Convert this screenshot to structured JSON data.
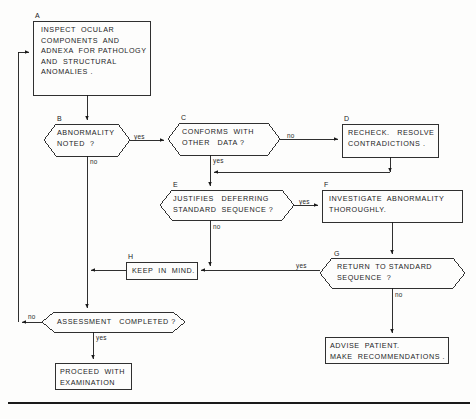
{
  "diagram": {
    "line_color": "#1a1a1a",
    "background": "#fdfdfc",
    "nodes": [
      {
        "id": "A",
        "tag": "A",
        "type": "process",
        "lines": [
          "INSPECT  OCULAR",
          "COMPONENTS  AND",
          "ADNEXA  FOR PATHOLOGY",
          "AND  STRUCTURAL",
          "ANOMALIES ."
        ]
      },
      {
        "id": "B",
        "tag": "B",
        "type": "decision",
        "lines": [
          "ABNORMALITY",
          "NOTED  ?"
        ]
      },
      {
        "id": "C",
        "tag": "C",
        "type": "decision",
        "lines": [
          "CONFORMS  WITH",
          "OTHER   DATA ?"
        ]
      },
      {
        "id": "D",
        "tag": "D",
        "type": "process",
        "lines": [
          "RECHECK.   RESOLVE",
          "CONTRADICTIONS ."
        ]
      },
      {
        "id": "E",
        "tag": "E",
        "type": "decision",
        "lines": [
          "JUSTIFIES   DEFERRING",
          "STANDARD  SEQUENCE ?"
        ]
      },
      {
        "id": "F",
        "tag": "F",
        "type": "process",
        "lines": [
          "INVESTIGATE  ABNORMALITY",
          "THOROUGHLY."
        ]
      },
      {
        "id": "G",
        "tag": "G",
        "type": "decision",
        "lines": [
          "RETURN  TO STANDARD",
          "SEQUENCE  ?"
        ]
      },
      {
        "id": "H",
        "tag": "H",
        "type": "process",
        "lines": [
          "KEEP  IN  MIND."
        ]
      },
      {
        "id": "I",
        "tag": "",
        "type": "decision",
        "lines": [
          "ASSESSMENT   COMPLETED ?"
        ]
      },
      {
        "id": "J",
        "tag": "",
        "type": "process",
        "lines": [
          "PROCEED  WITH",
          "EXAMINATION"
        ]
      },
      {
        "id": "K",
        "tag": "",
        "type": "process",
        "lines": [
          "ADVISE  PATIENT.",
          "MAKE  RECOMMENDATIONS ."
        ]
      }
    ],
    "edge_labels": {
      "b_yes": "yes",
      "b_no": "no",
      "c_no": "no",
      "c_yes": "yes",
      "e_yes": "yes",
      "e_no": "no",
      "g_yes": "yes",
      "g_no": "no",
      "i_no": "no",
      "i_yes": "yes"
    }
  }
}
